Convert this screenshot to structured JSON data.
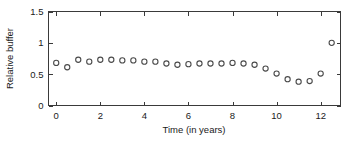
{
  "chart_data": {
    "type": "scatter",
    "title": "",
    "xlabel": "Time (in years)",
    "ylabel": "Relative buffer",
    "xlim": [
      -0.35,
      12.9
    ],
    "ylim": [
      0,
      1.5
    ],
    "xticks": [
      0,
      2,
      4,
      6,
      8,
      10,
      12
    ],
    "xticklabels": [
      "0",
      "2",
      "4",
      "6",
      "8",
      "10",
      "12"
    ],
    "yticks": [
      0,
      0.5,
      1,
      1.5
    ],
    "yticklabels": [
      "0",
      "0.5",
      "1",
      "1.5"
    ],
    "grid": false,
    "legend": null,
    "marker": "open-circle",
    "marker_color": "#4a4a4a",
    "series": [
      {
        "name": "Relative buffer",
        "x": [
          0,
          0.5,
          1,
          1.5,
          2,
          2.5,
          3,
          3.5,
          4,
          4.5,
          5,
          5.5,
          6,
          6.5,
          7,
          7.5,
          8,
          8.5,
          9,
          9.5,
          10,
          10.5,
          11,
          11.5,
          12,
          12.5
        ],
        "values": [
          0.68,
          0.61,
          0.73,
          0.7,
          0.73,
          0.73,
          0.72,
          0.72,
          0.7,
          0.7,
          0.67,
          0.65,
          0.66,
          0.67,
          0.67,
          0.67,
          0.68,
          0.67,
          0.65,
          0.59,
          0.51,
          0.42,
          0.38,
          0.39,
          0.51,
          1.0
        ]
      }
    ]
  },
  "axes": {
    "x_axis_name": "time-axis",
    "y_axis_name": "relative-buffer-axis"
  }
}
